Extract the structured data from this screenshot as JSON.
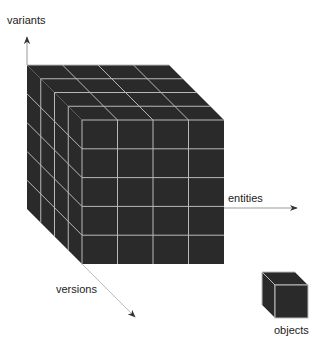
{
  "diagram": {
    "type": "3d-data-cube",
    "axes": {
      "vertical": {
        "label": "variants"
      },
      "horizontal": {
        "label": "entities"
      },
      "depth": {
        "label": "versions"
      }
    },
    "cube": {
      "columns": 4,
      "rows": 5,
      "depth_layers": 4,
      "fill_color": "#2a2a2a",
      "grid_color": "#b8b8b8"
    },
    "legend": {
      "label": "objects"
    },
    "colors": {
      "axis": "#999999",
      "arrowhead": "#333333",
      "text": "#222222"
    }
  }
}
